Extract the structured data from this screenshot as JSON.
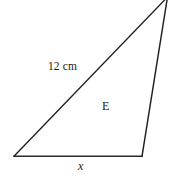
{
  "figure": {
    "type": "geometry-diagram",
    "shape": "triangle",
    "background_color": "#ffffff",
    "stroke_color": "#231f20",
    "stroke_width": 1.3,
    "canvas": {
      "width": 174,
      "height": 181
    },
    "vertices": {
      "bottom_left": {
        "x": 14,
        "y": 156
      },
      "bottom_right": {
        "x": 142,
        "y": 156
      },
      "apex_top_right": {
        "x": 167,
        "y": -2
      }
    },
    "edges": [
      {
        "name": "base",
        "from": "bottom_left",
        "to": "bottom_right",
        "label": "x"
      },
      {
        "name": "hypotenuse",
        "from": "bottom_left",
        "to": "apex_top_right",
        "label": "12 cm"
      },
      {
        "name": "right-side",
        "from": "bottom_right",
        "to": "apex_top_right",
        "label": ""
      }
    ],
    "labels": {
      "side_length": "12 cm",
      "region": "E",
      "base_variable": "x"
    }
  }
}
